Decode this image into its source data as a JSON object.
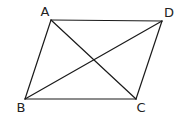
{
  "diagram": {
    "type": "parallelogram-with-diagonals",
    "background": "#ffffff",
    "line_color": "#1a1a1a",
    "vertices": {
      "A": {
        "label": "A",
        "x": 51,
        "y": 20,
        "label_x": 45,
        "label_y": 16
      },
      "B": {
        "label": "B",
        "x": 25,
        "y": 99,
        "label_x": 21,
        "label_y": 112
      },
      "C": {
        "label": "C",
        "x": 136,
        "y": 99,
        "label_x": 141,
        "label_y": 112
      },
      "D": {
        "label": "D",
        "x": 162,
        "y": 21,
        "label_x": 169,
        "label_y": 17
      }
    },
    "edges": [
      {
        "from": "A",
        "to": "D",
        "kind": "side"
      },
      {
        "from": "D",
        "to": "C",
        "kind": "side"
      },
      {
        "from": "C",
        "to": "B",
        "kind": "side"
      },
      {
        "from": "B",
        "to": "A",
        "kind": "side"
      },
      {
        "from": "A",
        "to": "C",
        "kind": "diagonal"
      },
      {
        "from": "B",
        "to": "D",
        "kind": "diagonal"
      }
    ]
  }
}
